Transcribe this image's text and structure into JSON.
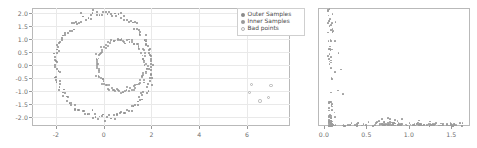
{
  "figure": {
    "background": "#ffffff",
    "panel_count": 2,
    "colors": {
      "outer_samples": "#8b8b8b",
      "inner_samples": "#9a9a9a",
      "bad_points": "#b5b5b5",
      "grid": "#e9e9e9",
      "axis": "#b9b9b9",
      "tick_text": "#6e6e6e"
    }
  },
  "legend": {
    "position": "upper right",
    "items": [
      {
        "label": "Outer Samples",
        "marker": "dot",
        "color": "#8b8b8b"
      },
      {
        "label": "Inner Samples",
        "marker": "dot",
        "color": "#9a9a9a"
      },
      {
        "label": "Bad points",
        "marker": "open-circle",
        "color": "#b5b5b5"
      }
    ]
  },
  "chart_data": [
    {
      "id": "left",
      "type": "scatter",
      "title": "",
      "xlabel": "",
      "ylabel": "",
      "xlim": [
        -3.0,
        7.8
      ],
      "ylim": [
        -2.35,
        2.2
      ],
      "grid": true,
      "xticks": [
        "-2",
        "0",
        "2",
        "4",
        "6"
      ],
      "xtick_values": [
        -2,
        0,
        2,
        4,
        6
      ],
      "yticks": [
        "2.0",
        "1.5",
        "1.0",
        "0.5",
        "0.0",
        "-0.5",
        "-1.0",
        "-1.5",
        "-2.0"
      ],
      "ytick_values": [
        2.0,
        1.5,
        1.0,
        0.5,
        0.0,
        -0.5,
        -1.0,
        -1.5,
        -2.0
      ],
      "series": [
        {
          "name": "Outer Samples",
          "description": "noisy ring centered near (0,0) with radius about 2.0",
          "center": [
            0.0,
            0.0
          ],
          "radius": 2.0,
          "noise": 0.07,
          "n": 160
        },
        {
          "name": "Inner Samples",
          "description": "noisy ring centered near (0.75,0.0) with radius about 1.0",
          "center": [
            0.75,
            0.0
          ],
          "radius": 1.0,
          "noise": 0.06,
          "n": 110
        },
        {
          "name": "Bad points",
          "description": "scattered outliers far right, below zero",
          "points": [
            [
              6.2,
              -0.75
            ],
            [
              7.0,
              -0.78
            ],
            [
              6.1,
              -1.05
            ],
            [
              6.9,
              -1.25
            ],
            [
              6.55,
              -1.38
            ]
          ],
          "n": 5
        }
      ]
    },
    {
      "id": "right",
      "type": "scatter",
      "title": "",
      "xlabel": "",
      "ylabel": "",
      "xlim": [
        -0.07,
        1.72
      ],
      "ylim": [
        0.0,
        1.0
      ],
      "grid": false,
      "xticks": [
        "0.0",
        "0.5",
        "1.0",
        "1.5"
      ],
      "xtick_values": [
        0.0,
        0.5,
        1.0,
        1.5
      ],
      "yticks": [],
      "ytick_values": [],
      "series": [
        {
          "name": "distribution",
          "description": "L-shaped cloud: sparse vertical stack near x=0.05-0.15 spanning full height, plus dense horizontal band along the bottom from x=0.15 to x=1.65",
          "n": 210
        }
      ]
    }
  ]
}
